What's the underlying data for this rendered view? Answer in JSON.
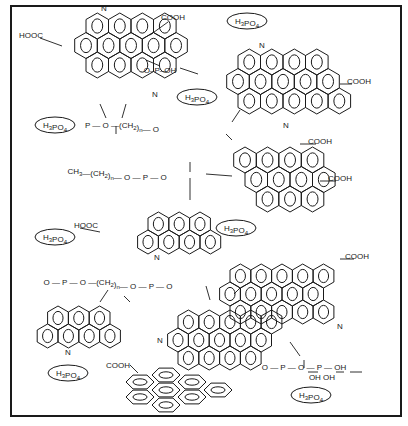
{
  "colors": {
    "ink": "#1a1a1a",
    "background": "#ffffff"
  },
  "h3po4_labels": [
    {
      "x": 247,
      "y": 24,
      "text": "H3PO4"
    },
    {
      "x": 197,
      "y": 100,
      "text": "H3PO4"
    },
    {
      "x": 55,
      "y": 128,
      "text": "H3PO4"
    },
    {
      "x": 55,
      "y": 240,
      "text": "H3PO4"
    },
    {
      "x": 236,
      "y": 231,
      "text": "H3PO4"
    },
    {
      "x": 68,
      "y": 376,
      "text": "H3PO4"
    },
    {
      "x": 311,
      "y": 398,
      "text": "H3PO4"
    }
  ],
  "group_labels": [
    {
      "x": 173,
      "y": 20,
      "text": "COOH"
    },
    {
      "x": 31,
      "y": 38,
      "text": "HOOC"
    },
    {
      "x": 359,
      "y": 84,
      "text": "COOH"
    },
    {
      "x": 320,
      "y": 144,
      "text": "COOH"
    },
    {
      "x": 340,
      "y": 181,
      "text": "COOH"
    },
    {
      "x": 86,
      "y": 228,
      "text": "HOOC"
    },
    {
      "x": 357,
      "y": 259,
      "text": "COOH"
    },
    {
      "x": 118,
      "y": 368,
      "text": "COOH"
    },
    {
      "x": 104,
      "y": 11,
      "text": "N"
    },
    {
      "x": 155,
      "y": 97,
      "text": "N"
    },
    {
      "x": 262,
      "y": 48,
      "text": "N"
    },
    {
      "x": 286,
      "y": 128,
      "text": "N"
    },
    {
      "x": 157,
      "y": 260,
      "text": "N"
    },
    {
      "x": 68,
      "y": 355,
      "text": "N"
    },
    {
      "x": 160,
      "y": 343,
      "text": "N"
    },
    {
      "x": 340,
      "y": 329,
      "text": "N"
    }
  ],
  "linkers": [
    {
      "x": 160,
      "y": 73,
      "text": "O–P–OH"
    },
    {
      "x": 122,
      "y": 128,
      "text": "P — O —(CH2)n— O"
    },
    {
      "x": 117,
      "y": 174,
      "text": "CH3—(CH2)n— O — P — O"
    },
    {
      "x": 108,
      "y": 285,
      "text": "O — P — O —(CH2)n— O — P — O"
    },
    {
      "x": 304,
      "y": 370,
      "text": "O — P — O — P — OH"
    },
    {
      "x": 322,
      "y": 380,
      "text": "OH        OH"
    }
  ]
}
